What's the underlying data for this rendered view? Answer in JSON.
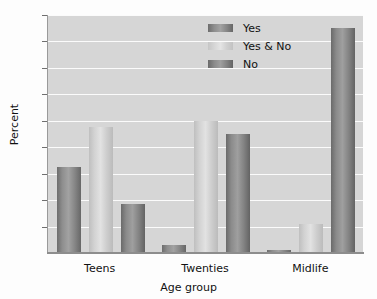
{
  "chart_data": {
    "type": "bar",
    "title": "",
    "xlabel": "Age group",
    "ylabel": "Percent",
    "categories": [
      "Teens",
      "Twenties",
      "Midlife"
    ],
    "series": [
      {
        "name": "Yes",
        "values": [
          32.5,
          3.0,
          1.0
        ],
        "color": "#8b8b8b"
      },
      {
        "name": "Yes & No",
        "values": [
          47.5,
          50.0,
          11.0
        ],
        "color": "#dcdcdc"
      },
      {
        "name": "No",
        "values": [
          18.5,
          45.0,
          85.0
        ],
        "color": "#888888"
      }
    ],
    "ylim": [
      0,
      90
    ],
    "yticks": [
      0,
      10,
      20,
      30,
      40,
      50,
      60,
      70,
      80,
      90
    ],
    "grid": true,
    "legend_position": "top-right",
    "plot_background": "#d6d6d6",
    "gridline_color": "#fbfbfb"
  },
  "legend": {
    "items": [
      {
        "label": "Yes"
      },
      {
        "label": "Yes & No"
      },
      {
        "label": "No"
      }
    ]
  },
  "axes": {
    "y_title": "Percent",
    "x_title": "Age group",
    "y_ticks": [
      "90",
      "80",
      "70",
      "60",
      "50",
      "40",
      "30",
      "20",
      "10",
      "0"
    ],
    "x_ticks": [
      "Teens",
      "Twenties",
      "Midlife"
    ]
  }
}
